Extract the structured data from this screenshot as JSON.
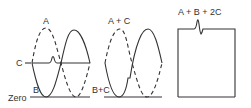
{
  "diagram": {
    "panel1": {
      "label_a": "A",
      "label_c": "C",
      "label_b": "B",
      "label_zero": "Zero"
    },
    "panel2": {
      "label_top": "A + C",
      "label_bottom": "B+C"
    },
    "panel3": {
      "label_top": "A + B + 2C"
    },
    "colors": {
      "line": "#333333",
      "background": "#ffffff"
    }
  }
}
